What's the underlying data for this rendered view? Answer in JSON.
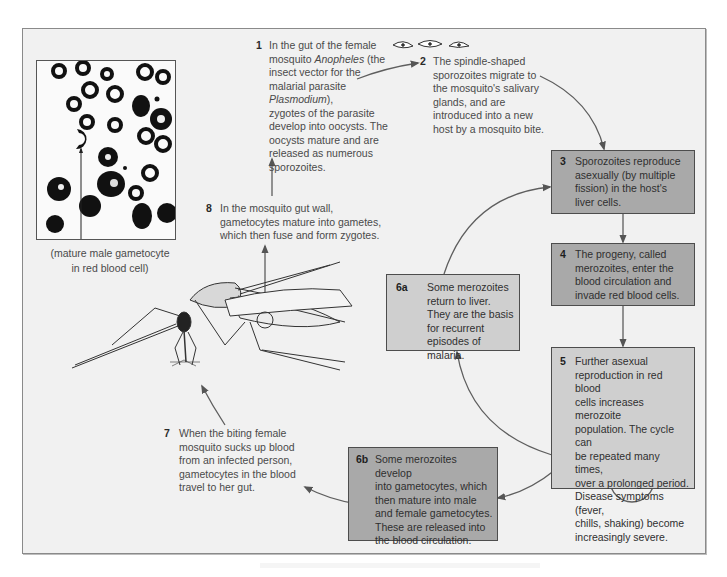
{
  "figure": {
    "photo_caption_line1": "(mature male gametocyte",
    "photo_caption_line2": "in red blood cell)"
  },
  "steps": {
    "s1": {
      "number": "1",
      "lines": [
        "In the gut of the female",
        "mosquito Anopheles (the",
        "insect vector for the",
        "malarial parasite Plasmodium),",
        "zygotes of the parasite",
        "develop into oocysts. The",
        "oocysts mature and are",
        "released as numerous",
        "sporozoites."
      ]
    },
    "s2": {
      "number": "2",
      "lines": [
        "The spindle-shaped",
        "sporozoites migrate to",
        "the mosquito's salivary",
        "glands, and are",
        "introduced into a new",
        "host by a mosquito bite."
      ]
    },
    "s3": {
      "number": "3",
      "lines": [
        "Sporozoites reproduce",
        "asexually (by multiple",
        "fission) in the host's",
        "liver cells."
      ]
    },
    "s4": {
      "number": "4",
      "lines": [
        "The progeny, called",
        "merozoites, enter the",
        "blood circulation and",
        "invade red blood cells."
      ]
    },
    "s5": {
      "number": "5",
      "lines": [
        "Further asexual",
        "reproduction in red blood",
        "cells increases merozoite",
        "population. The cycle can",
        "be repeated many times,",
        "over a prolonged period.",
        "Disease symptoms (fever,",
        "chills, shaking) become",
        "increasingly severe."
      ]
    },
    "s6a": {
      "number": "6a",
      "lines": [
        "Some merozoites",
        "return to liver.",
        "They are the basis",
        "for recurrent",
        "episodes of malaria."
      ]
    },
    "s6b": {
      "number": "6b",
      "lines": [
        "Some merozoites develop",
        "into gametocytes, which",
        "then mature into male",
        "and female gametocytes.",
        "These are released into",
        "the blood circulation."
      ]
    },
    "s7": {
      "number": "7",
      "lines": [
        "When the biting female",
        "mosquito sucks up blood",
        "from an infected person,",
        "gametocytes in the blood",
        "travel to her gut."
      ]
    },
    "s8": {
      "number": "8",
      "lines": [
        "In the mosquito gut wall,",
        "gametocytes mature into gametes,",
        "which then fuse and form zygotes."
      ]
    }
  },
  "colors": {
    "frame_bg": "#f1f1f1",
    "box_dark": "#a9a9a9",
    "box_light": "#cfcfcf",
    "arrow": "#5a5a5a",
    "text": "#3a3a3a"
  },
  "icons": {
    "sporozoites": "spindle-shaped-sporozoite-icons",
    "mosquito": "mosquito-illustration",
    "micrograph": "blood-smear-micrograph"
  }
}
